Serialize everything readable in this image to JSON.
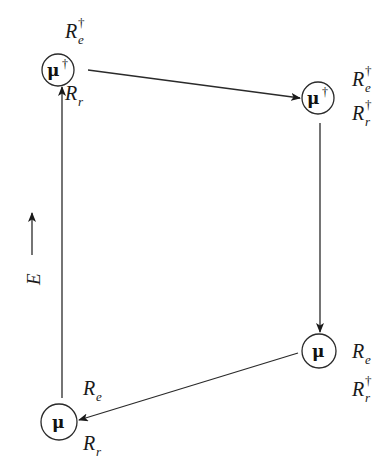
{
  "diagram": {
    "type": "cycle",
    "nodes": [
      {
        "id": "top-left",
        "symbol": "μ",
        "dagger": "†",
        "labels": [
          {
            "base": "R",
            "sub": "e",
            "sup": "†"
          },
          {
            "base": "R",
            "sub": "r",
            "sup": ""
          }
        ]
      },
      {
        "id": "top-right",
        "symbol": "μ",
        "dagger": "†",
        "labels": [
          {
            "base": "R",
            "sub": "e",
            "sup": "†"
          },
          {
            "base": "R",
            "sub": "r",
            "sup": "†"
          }
        ]
      },
      {
        "id": "bottom-right",
        "symbol": "μ",
        "dagger": "",
        "labels": [
          {
            "base": "R",
            "sub": "e",
            "sup": ""
          },
          {
            "base": "R",
            "sub": "r",
            "sup": "†"
          }
        ]
      },
      {
        "id": "bottom-left",
        "symbol": "μ",
        "dagger": "",
        "labels": [
          {
            "base": "R",
            "sub": "e",
            "sup": ""
          },
          {
            "base": "R",
            "sub": "r",
            "sup": ""
          }
        ]
      }
    ],
    "edges": [
      {
        "from": "top-left",
        "to": "top-right"
      },
      {
        "from": "top-right",
        "to": "bottom-right"
      },
      {
        "from": "bottom-right",
        "to": "bottom-left"
      },
      {
        "from": "bottom-left",
        "to": "top-left"
      }
    ],
    "axis": {
      "label": "E",
      "direction": "up"
    }
  }
}
